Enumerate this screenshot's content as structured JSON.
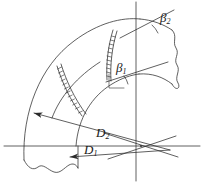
{
  "figure": {
    "kind": "engineering-line-drawing",
    "stroke_color": "#2b2b2b",
    "background_color": "#ffffff",
    "labels": {
      "beta2": {
        "symbol": "β",
        "subscript": "2",
        "text": "β2"
      },
      "beta1": {
        "symbol": "β",
        "subscript": "1",
        "text": "β1"
      },
      "d2": {
        "symbol": "D",
        "subscript": "2",
        "text": "D2"
      },
      "d1": {
        "symbol": "D",
        "subscript": "1",
        "text": "D1"
      }
    },
    "elements": {
      "outer_arc": "outer-wall-arc",
      "inner_arc": "inner-wall-arc",
      "vane_band_outer": "hatched-vane-band-outer",
      "vane_band_inner": "hatched-vane-band-inner",
      "break_line_bottom": "wavy-break-line-bottom",
      "break_line_right": "wavy-break-line-right",
      "vertical_axis": "vertical-centerline",
      "horizontal_axis": "horizontal-centerline",
      "ray_d2": "diameter-ray-d2",
      "ray_d1": "diameter-ray-d1",
      "tangent_beta2": "tangent-ray-beta2",
      "tangent_beta1": "tangent-ray-beta1",
      "angle_arc_beta2": "angle-arc-beta2",
      "angle_arc_beta1": "angle-arc-beta1",
      "center_point": "arc-center-point"
    }
  }
}
